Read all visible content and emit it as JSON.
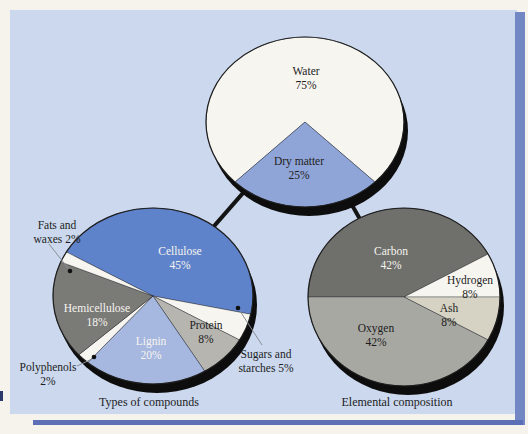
{
  "palette": {
    "page-bg": "#f5f3ec",
    "panel-bg": "#cbd8ed",
    "accent-strip": "#7287c4",
    "accent-line": "#5c6fb6",
    "shadow": "#0d0d0d",
    "connector": "#141414",
    "leader": "#8a8f96",
    "text-dark": "#1d1d1d",
    "text-light": "#f6f5ef",
    "outline": "#1e1e1e"
  },
  "chart_data": [
    {
      "id": "water-dry-matter",
      "type": "pie",
      "title": "",
      "slices": [
        {
          "label": "Water",
          "pct": 75,
          "color": "#f7f5f0",
          "text_color": "#1d1d1d",
          "lines": [
            "Water",
            "75%"
          ],
          "at": [
            306,
            71
          ]
        },
        {
          "label": "Dry matter",
          "pct": 25,
          "color": "#90a5d7",
          "text_color": "#1d1d1d",
          "lines": [
            "Dry matter",
            "25%"
          ],
          "at": [
            299,
            161
          ]
        }
      ],
      "layout": {
        "cx": 305,
        "cy": 122,
        "rx": 99,
        "ry": 85,
        "start": 225,
        "shadow": [
          4,
          9
        ]
      }
    },
    {
      "id": "types-of-compounds",
      "type": "pie",
      "title": "Types of compounds",
      "slices": [
        {
          "label": "Cellulose",
          "pct": 45,
          "color": "#5f83ca",
          "text_color": "#f6f5ef",
          "lines": [
            "Cellulose",
            "45%"
          ],
          "at": [
            180,
            251
          ]
        },
        {
          "label": "Sugars and starches",
          "pct": 5,
          "color": "#f7f5f0",
          "callout": {
            "lines": [
              "Sugars and",
              "starches 5%"
            ],
            "at": [
              266,
              354
            ],
            "leader": [
              [
                262,
                345
              ],
              [
                240,
                311
              ]
            ],
            "dot": [
              238,
              308
            ]
          }
        },
        {
          "label": "Protein",
          "pct": 8,
          "color": "#b6b5b0",
          "text_color": "#1d1d1d",
          "lines": [
            "Protein",
            "8%"
          ],
          "at": [
            206,
            325
          ]
        },
        {
          "label": "Lignin",
          "pct": 20,
          "color": "#a6b7e0",
          "text_color": "#f6f5ef",
          "lines": [
            "Lignin",
            "20%"
          ],
          "at": [
            151,
            341
          ]
        },
        {
          "label": "Polyphenols",
          "pct": 2,
          "color": "#f7f5f0",
          "callout": {
            "lines": [
              "Polyphenols",
              "2%"
            ],
            "at": [
              48,
              367
            ],
            "leader": [
              [
                77,
                366
              ],
              [
                92,
                359
              ]
            ],
            "dot": [
              94,
              357
            ]
          }
        },
        {
          "label": "Hemicellulose",
          "pct": 18,
          "color": "#7a7a77",
          "text_color": "#f6f5ef",
          "lines": [
            "Hemicellulose",
            "18%"
          ],
          "at": [
            97,
            308
          ]
        },
        {
          "label": "Fats and waxes",
          "pct": 2,
          "color": "#f7f5f0",
          "callout": {
            "lines": [
              "Fats and",
              "waxes 2%"
            ],
            "at": [
              57,
              225
            ],
            "leader": [
              [
                49,
                244
              ],
              [
                68,
                268
              ]
            ],
            "dot": [
              70,
              271
            ]
          }
        }
      ],
      "layout": {
        "cx": 153,
        "cy": 296,
        "rx": 100,
        "ry": 88,
        "start": 300,
        "shadow": [
          4,
          9
        ]
      }
    },
    {
      "id": "elemental-composition",
      "type": "pie",
      "title": "Elemental composition",
      "slices": [
        {
          "label": "Carbon",
          "pct": 42,
          "color": "#6f6f6c",
          "text_color": "#f6f5ef",
          "lines": [
            "Carbon",
            "42%"
          ],
          "at": [
            391,
            251
          ]
        },
        {
          "label": "Hydrogen",
          "pct": 8,
          "color": "#f7f5f0",
          "text_color": "#1d1d1d",
          "lines": [
            "Hydrogen",
            "8%"
          ],
          "at": [
            470,
            280
          ]
        },
        {
          "label": "Ash",
          "pct": 8,
          "color": "#d6d3c4",
          "text_color": "#1d1d1d",
          "lines": [
            "Ash",
            "8%"
          ],
          "at": [
            449,
            308
          ]
        },
        {
          "label": "Oxygen",
          "pct": 42,
          "color": "#a8a8a3",
          "text_color": "#1d1d1d",
          "lines": [
            "Oxygen",
            "42%"
          ],
          "at": [
            376,
            328
          ]
        }
      ],
      "layout": {
        "cx": 404,
        "cy": 297,
        "rx": 96,
        "ry": 89,
        "start": 270,
        "shadow": [
          4,
          9
        ]
      }
    }
  ],
  "layout": {
    "connectors": [
      [
        305,
        122,
        153,
        296
      ],
      [
        305,
        122,
        404,
        297
      ]
    ]
  }
}
